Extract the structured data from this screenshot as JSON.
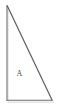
{
  "figure": {
    "kind": "right-triangle-outline",
    "background_color": "#ffffff",
    "canvas": {
      "width": 60,
      "height": 109
    },
    "stroke": {
      "color": "#6e6e6e",
      "hypotenuse_color": "#5a5a5a",
      "width": 1.1
    },
    "shadow": {
      "color": "#cfcfcf",
      "offset_x": 1,
      "offset_y": 2
    },
    "vertices": [
      {
        "name": "apex-top-left",
        "x": 7,
        "y": 6
      },
      {
        "name": "right-angle-bottom-left",
        "x": 7,
        "y": 100
      },
      {
        "name": "bottom-right",
        "x": 52,
        "y": 100
      }
    ],
    "edges": [
      {
        "name": "left-leg-vertical",
        "from": "apex-top-left",
        "to": "right-angle-bottom-left"
      },
      {
        "name": "bottom-leg-horizontal",
        "from": "right-angle-bottom-left",
        "to": "bottom-right"
      },
      {
        "name": "hypotenuse",
        "from": "apex-top-left",
        "to": "bottom-right"
      }
    ],
    "labels": [
      {
        "name": "region-label-a",
        "text": "A",
        "x": 19,
        "y": 74,
        "color": "#4a4a4a"
      }
    ]
  }
}
